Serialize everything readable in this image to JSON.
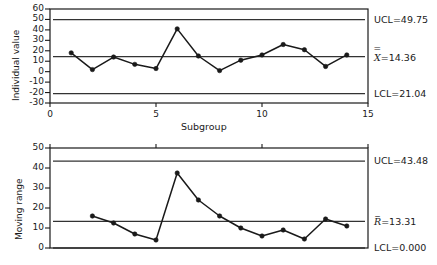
{
  "chart_data": [
    {
      "type": "line",
      "name": "individuals-chart",
      "title": "",
      "xlabel": "Subgroup",
      "ylabel": "Individual value",
      "xlim": [
        0,
        15
      ],
      "ylim": [
        -30,
        60
      ],
      "xticks": [
        0,
        5,
        10,
        15
      ],
      "yticks": [
        -30,
        -20,
        -10,
        0,
        10,
        20,
        30,
        40,
        50,
        60
      ],
      "grid": false,
      "legend": "none",
      "x": [
        1,
        2,
        3,
        4,
        5,
        6,
        7,
        8,
        9,
        10,
        11,
        12,
        13,
        14
      ],
      "values": [
        18,
        2,
        14,
        7,
        3,
        41,
        15,
        1,
        11,
        16,
        26,
        21,
        5,
        16
      ],
      "control_limits": {
        "ucl": 49.75,
        "center": 14.36,
        "lcl": -21.04
      },
      "annotations": [
        {
          "text": "UCL=49.75",
          "at_y": 49.75
        },
        {
          "text": "X=14.36",
          "at_y": 14.36
        },
        {
          "text": "LCL=21.04",
          "at_y": -21.04
        }
      ]
    },
    {
      "type": "line",
      "name": "moving-range-chart",
      "title": "",
      "xlabel": "",
      "ylabel": "Moving range",
      "xlim": [
        0,
        15
      ],
      "ylim": [
        0,
        50
      ],
      "xticks": [
        0,
        5,
        10,
        15
      ],
      "yticks": [
        0,
        10,
        20,
        30,
        40,
        50
      ],
      "grid": false,
      "legend": "none",
      "x": [
        2,
        3,
        4,
        5,
        6,
        7,
        8,
        9,
        10,
        11,
        12,
        13,
        14
      ],
      "values": [
        16,
        12.5,
        7,
        4,
        37.5,
        24,
        16,
        10,
        6,
        9,
        4.5,
        14.5,
        11
      ],
      "control_limits": {
        "ucl": 43.48,
        "center": 13.31,
        "lcl": 0.0
      },
      "annotations": [
        {
          "text": "UCL=43.48",
          "at_y": 43.48
        },
        {
          "text": "R=13.31",
          "at_y": 13.31
        },
        {
          "text": "LCL=0.000",
          "at_y": 0.0
        }
      ]
    }
  ],
  "individuals": {
    "ylabel": "Individual value",
    "xlabel": "Subgroup",
    "yticks": [
      "60",
      "50",
      "40",
      "30",
      "20",
      "10",
      "0",
      "-10",
      "-20",
      "-30"
    ],
    "xticks": [
      "0",
      "5",
      "10",
      "15"
    ],
    "ucl_label": "UCL=49.75",
    "center_label": "=14.36",
    "center_symbol": "X",
    "center_overbar": "=",
    "lcl_label": "LCL=21.04"
  },
  "moving_range": {
    "ylabel": "Moving range",
    "xlabel": "",
    "yticks": [
      "50",
      "40",
      "30",
      "20",
      "10",
      "0"
    ],
    "xticks": [
      "",
      "",
      "",
      ""
    ],
    "ucl_label": "UCL=43.48",
    "center_label": "=13.31",
    "center_symbol": "R",
    "center_overbar": "_",
    "lcl_label": "LCL=0.000"
  },
  "style": {
    "line_color": "#1a1a1a",
    "marker_color": "#1a1a1a",
    "limit_color": "#333333",
    "frame_color": "#1a1a1a",
    "background": "#ffffff"
  }
}
